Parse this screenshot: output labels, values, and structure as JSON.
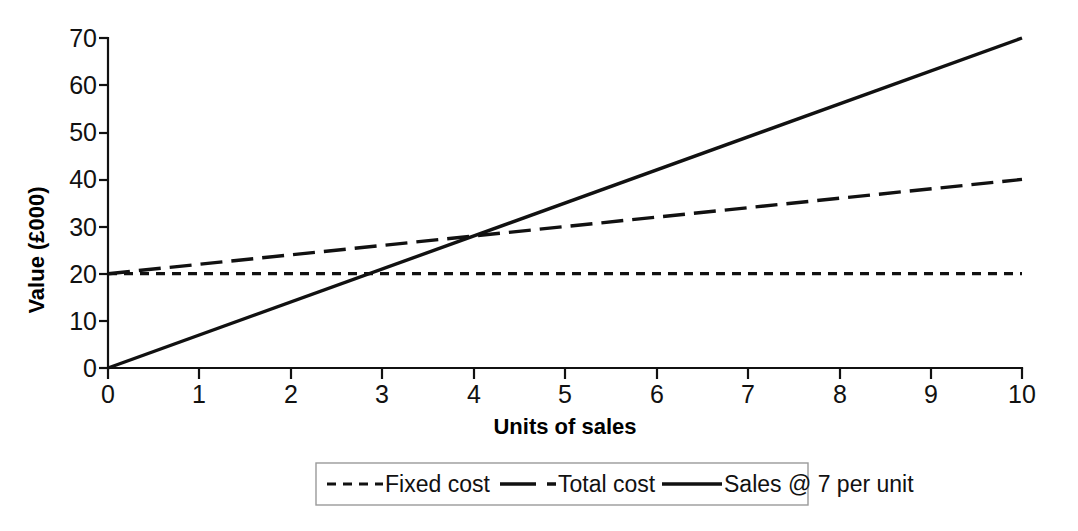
{
  "chart_data": {
    "type": "line",
    "title": "",
    "xlabel": "Units of sales",
    "ylabel": "Value (£000)",
    "xlim": [
      0,
      10
    ],
    "ylim": [
      0,
      70
    ],
    "x": [
      0,
      10
    ],
    "xticks": [
      "0",
      "1",
      "2",
      "3",
      "4",
      "5",
      "6",
      "7",
      "8",
      "9",
      "10"
    ],
    "yticks": [
      "0",
      "10",
      "20",
      "30",
      "40",
      "50",
      "60",
      "70"
    ],
    "grid": false,
    "legend_position": "bottom-center",
    "series": [
      {
        "name": "Fixed cost",
        "style": "dashed",
        "dash_pattern": "9,7",
        "width": 3.2,
        "color": "#111111",
        "values": [
          20,
          20
        ]
      },
      {
        "name": "Total cost",
        "style": "long-dashed",
        "dash_pattern": "22,9",
        "width": 3.4,
        "color": "#111111",
        "values": [
          20,
          40
        ]
      },
      {
        "name": "Sales @ 7 per unit",
        "style": "solid",
        "dash_pattern": "none",
        "width": 3.4,
        "color": "#111111",
        "values": [
          0,
          70
        ]
      }
    ],
    "annotations": {
      "breakeven_units": 4,
      "breakeven_value": 28
    }
  },
  "axes": {
    "y_title": "Value (£000)",
    "x_title": "Units of sales",
    "y_tick_labels": [
      "70",
      "60",
      "50",
      "40",
      "30",
      "20",
      "10",
      "0"
    ],
    "x_tick_labels": [
      "0",
      "1",
      "2",
      "3",
      "4",
      "5",
      "6",
      "7",
      "8",
      "9",
      "10"
    ]
  },
  "legend": {
    "items": [
      {
        "label": "Fixed cost",
        "swatch": "dashed-line-swatch"
      },
      {
        "label": "Total cost",
        "swatch": "long-dashed-line-swatch"
      },
      {
        "label": "Sales @ 7 per unit",
        "swatch": "solid-line-swatch"
      }
    ]
  }
}
